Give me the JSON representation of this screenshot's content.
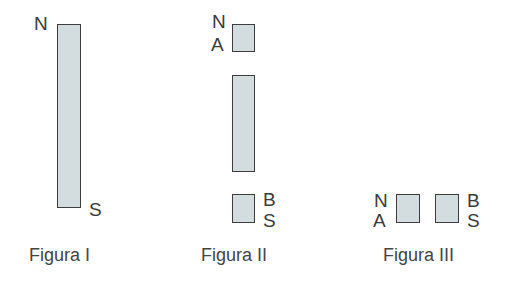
{
  "colors": {
    "magnet_fill": "#d3dde0",
    "magnet_border": "#3d3d3d",
    "text": "#3a3a3a"
  },
  "figures": [
    {
      "caption": "Figura I",
      "description": "Single bar magnet, north pole at top, south pole at bottom",
      "magnets": [
        {
          "id": "whole",
          "labels_left": [
            "N"
          ],
          "labels_right": [
            "S"
          ]
        }
      ],
      "labels": {
        "top_left": "N",
        "bottom_right": "S"
      }
    },
    {
      "caption": "Figura II",
      "description": "Magnet cut into three pieces: top piece (N/A), middle piece, bottom piece (B/S)",
      "labels": {
        "top_n": "N",
        "top_a": "A",
        "bottom_b": "B",
        "bottom_s": "S"
      }
    },
    {
      "caption": "Figura III",
      "description": "Two end pieces placed side by side: left piece (N/A), right piece (B/S)",
      "labels": {
        "left_n": "N",
        "left_a": "A",
        "right_b": "B",
        "right_s": "S"
      }
    }
  ]
}
